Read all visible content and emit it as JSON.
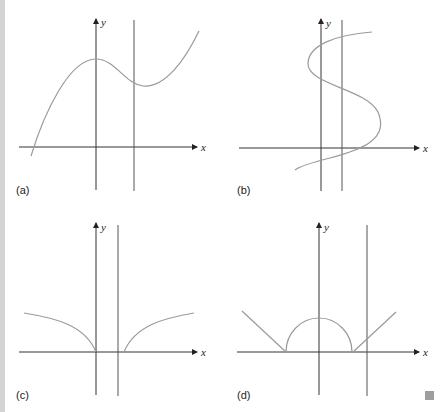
{
  "figure": {
    "panels": [
      {
        "label": "(a)",
        "x_axis_label": "x",
        "y_axis_label": "y",
        "curve": "cubic-like: rises to local max on y-axis, dips to local min right of vertical line, then rises"
      },
      {
        "label": "(b)",
        "x_axis_label": "x",
        "y_axis_label": "y",
        "curve": "S-shaped curve (x as function of y); vertical line intersects it more than once"
      },
      {
        "label": "(c)",
        "x_axis_label": "x",
        "y_axis_label": "y",
        "curve": "two concave branches meeting x-axis at origin and right of vertical line"
      },
      {
        "label": "(d)",
        "x_axis_label": "x",
        "y_axis_label": "y",
        "curve": "line segment, upper semicircle centered at origin, line segment"
      }
    ]
  },
  "colors": {
    "axis": "#333333",
    "curve": "#9a9a9a",
    "stripe": "#d4d4d4",
    "corner_square": "#9e9e9e"
  }
}
